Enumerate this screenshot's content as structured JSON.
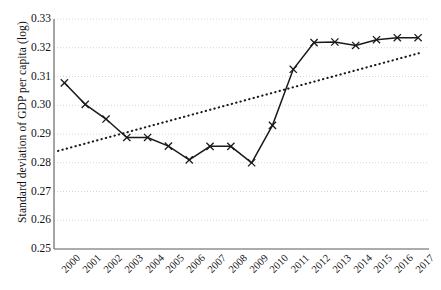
{
  "chart_data": {
    "type": "line",
    "title": "",
    "xlabel": "",
    "ylabel": "Standard deviation of GDP per capita (log)",
    "categories": [
      "2000",
      "2001",
      "2002",
      "2003",
      "2004",
      "2005",
      "2006",
      "2007",
      "2008",
      "2009",
      "2010",
      "2011",
      "2012",
      "2013",
      "2014",
      "2015",
      "2016",
      "2017"
    ],
    "x": [
      2000,
      2001,
      2002,
      2003,
      2004,
      2005,
      2006,
      2007,
      2008,
      2009,
      2010,
      2011,
      2012,
      2013,
      2014,
      2015,
      2016,
      2017
    ],
    "ylim": [
      0.25,
      0.33
    ],
    "yticks": [
      "0.25",
      "0.26",
      "0.27",
      "0.28",
      "0.29",
      "0.30",
      "0.31",
      "0.32",
      "0.33"
    ],
    "ytick_values": [
      0.25,
      0.26,
      0.27,
      0.28,
      0.29,
      0.3,
      0.31,
      0.32,
      0.33
    ],
    "grid": true,
    "grid_style": "dotted",
    "legend": "none",
    "series": [
      {
        "name": "Standard deviation of GDP per capita (log)",
        "style": "solid-line-with-x-markers",
        "marker": "x",
        "color": "#1a1a1a",
        "values": [
          0.3078,
          0.3003,
          0.2952,
          0.2888,
          0.2888,
          0.2858,
          0.281,
          0.2857,
          0.2857,
          0.28,
          0.293,
          0.3125,
          0.3218,
          0.322,
          0.3208,
          0.3228,
          0.3235,
          0.3235
        ]
      },
      {
        "name": "Linear trend",
        "style": "dotted-line",
        "marker": "none",
        "color": "#1a1a1a",
        "values": [
          0.2841,
          0.2866,
          0.2891,
          0.2916,
          0.2941,
          0.2965,
          0.299,
          0.3015,
          0.304,
          0.3065,
          0.309,
          0.3114,
          0.3139,
          0.3164,
          0.3189,
          0.3214,
          0.3239,
          0.3264
        ],
        "endpoints": {
          "x_start": 2000,
          "y_start": 0.2841,
          "x_end": 2017,
          "y_end": 0.3183
        }
      }
    ]
  },
  "axes": {
    "y_axis_title": "Standard deviation of GDP per capita (log)",
    "y_min_label": "0.25",
    "y_max_label": "0.33"
  }
}
